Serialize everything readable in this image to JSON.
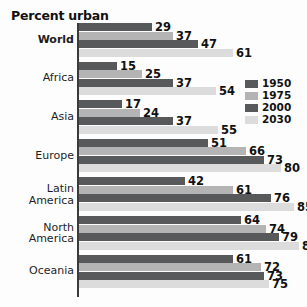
{
  "chart_data": {
    "type": "bar",
    "orientation": "horizontal",
    "title": "Percent urban",
    "xlabel": "",
    "ylabel": "",
    "xlim": [
      0,
      90
    ],
    "grid": false,
    "legend_position": "right",
    "categories": [
      "World",
      "Africa",
      "Asia",
      "Latin\nAmerica",
      "Europe",
      "North\nAmerica",
      "Oceania"
    ],
    "category_order": [
      "World",
      "Africa",
      "Asia",
      "Europe",
      "Latin America",
      "North America",
      "Oceania"
    ],
    "series": [
      {
        "name": "1950",
        "color": "#58595b",
        "values": [
          29,
          15,
          17,
          51,
          42,
          64,
          61
        ]
      },
      {
        "name": "1975",
        "color": "#b4b4b4",
        "values": [
          37,
          25,
          24,
          66,
          61,
          74,
          72
        ]
      },
      {
        "name": "2000",
        "color": "#58595b",
        "values": [
          47,
          37,
          37,
          73,
          76,
          79,
          73
        ]
      },
      {
        "name": "2030",
        "color": "#dcdcdc",
        "values": [
          61,
          54,
          55,
          80,
          85,
          87,
          75
        ]
      }
    ],
    "groups": [
      {
        "label": "World",
        "bold": true,
        "bars": [
          {
            "series": "1950",
            "value": 29,
            "label": "29"
          },
          {
            "series": "1975",
            "value": 37,
            "label": "37"
          },
          {
            "series": "2000",
            "value": 47,
            "label": "47"
          },
          {
            "series": "2030",
            "value": 61,
            "label": "61"
          }
        ]
      },
      {
        "label": "Africa",
        "bold": false,
        "bars": [
          {
            "series": "1950",
            "value": 15,
            "label": "15"
          },
          {
            "series": "1975",
            "value": 25,
            "label": "25"
          },
          {
            "series": "2000",
            "value": 37,
            "label": "37"
          },
          {
            "series": "2030",
            "value": 54,
            "label": "54"
          }
        ]
      },
      {
        "label": "Asia",
        "bold": false,
        "bars": [
          {
            "series": "1950",
            "value": 17,
            "label": "17"
          },
          {
            "series": "1975",
            "value": 24,
            "label": "24"
          },
          {
            "series": "2000",
            "value": 37,
            "label": "37"
          },
          {
            "series": "2030",
            "value": 55,
            "label": "55"
          }
        ]
      },
      {
        "label": "Europe",
        "bold": false,
        "bars": [
          {
            "series": "1950",
            "value": 51,
            "label": "51"
          },
          {
            "series": "1975",
            "value": 66,
            "label": "66"
          },
          {
            "series": "2000",
            "value": 73,
            "label": "73"
          },
          {
            "series": "2030",
            "value": 80,
            "label": "80"
          }
        ]
      },
      {
        "label": "Latin\nAmerica",
        "bold": false,
        "bars": [
          {
            "series": "1950",
            "value": 42,
            "label": "42"
          },
          {
            "series": "1975",
            "value": 61,
            "label": "61"
          },
          {
            "series": "2000",
            "value": 76,
            "label": "76"
          },
          {
            "series": "2030",
            "value": 85,
            "label": "85"
          }
        ]
      },
      {
        "label": "North\nAmerica",
        "bold": false,
        "bars": [
          {
            "series": "1950",
            "value": 64,
            "label": "64"
          },
          {
            "series": "1975",
            "value": 74,
            "label": "74"
          },
          {
            "series": "2000",
            "value": 79,
            "label": "79"
          },
          {
            "series": "2030",
            "value": 87,
            "label": "87"
          }
        ]
      },
      {
        "label": "Oceania",
        "bold": false,
        "bars": [
          {
            "series": "1950",
            "value": 61,
            "label": "61"
          },
          {
            "series": "1975",
            "value": 72,
            "label": "72"
          },
          {
            "series": "2000",
            "value": 73,
            "label": "73"
          },
          {
            "series": "2030",
            "value": 75,
            "label": "75"
          }
        ]
      }
    ]
  },
  "legend": {
    "items": [
      {
        "label": "1950",
        "color": "#58595b"
      },
      {
        "label": "1975",
        "color": "#b4b4b4"
      },
      {
        "label": "2000",
        "color": "#58595b"
      },
      {
        "label": "2030",
        "color": "#dcdcdc"
      }
    ]
  },
  "layout": {
    "px_per_unit": 2.53,
    "bar_height_px": 8,
    "bar_gap_px": 0.5,
    "group_pitch_px": 38.6,
    "axis_x_px": 77
  }
}
